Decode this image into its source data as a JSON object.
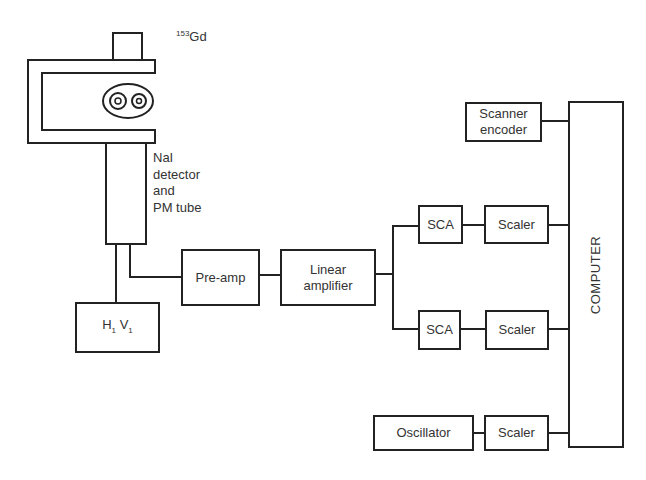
{
  "diagram": {
    "type": "block-diagram",
    "colors": {
      "line": "#222222",
      "text": "#333333",
      "background": "#ffffff"
    },
    "source": {
      "mass_number": "153",
      "element": "Gd"
    },
    "detector_label": [
      "NaI",
      "detector",
      "and",
      "PM tube"
    ],
    "hv_box": {
      "h": "H",
      "h_sub": "1",
      "v": "V",
      "v_sub": "1"
    },
    "blocks": {
      "preamp": "Pre-amp",
      "linear_amp_line1": "Linear",
      "linear_amp_line2": "amplifier",
      "sca_top": "SCA",
      "scaler_top": "Scaler",
      "sca_bottom": "SCA",
      "scaler_bottom": "Scaler",
      "scanner_line1": "Scanner",
      "scanner_line2": "encoder",
      "oscillator": "Oscillator",
      "scaler_osc": "Scaler",
      "computer": "COMPUTER"
    },
    "connections": [
      [
        "detector",
        "hv-supply"
      ],
      [
        "detector",
        "preamp"
      ],
      [
        "preamp",
        "linear-amplifier"
      ],
      [
        "linear-amplifier",
        "sca-top"
      ],
      [
        "linear-amplifier",
        "sca-bottom"
      ],
      [
        "sca-top",
        "scaler-top"
      ],
      [
        "sca-bottom",
        "scaler-bottom"
      ],
      [
        "scaler-top",
        "computer"
      ],
      [
        "scaler-bottom",
        "computer"
      ],
      [
        "scanner-encoder",
        "computer"
      ],
      [
        "oscillator",
        "scaler-osc"
      ],
      [
        "scaler-osc",
        "computer"
      ]
    ]
  }
}
